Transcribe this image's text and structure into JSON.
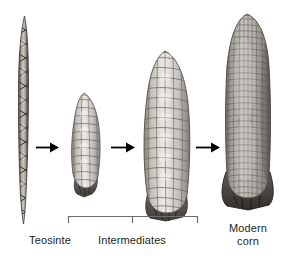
{
  "figure": {
    "background_color": "#ffffff",
    "text_color": "#231f20",
    "arrow_color": "#000000",
    "bracket_color": "#6d6e71"
  },
  "specimens": [
    {
      "id": "teosinte",
      "name": "teosinte-ear",
      "label": "Teosinte",
      "description": "narrow two-ranked spike with few triangular fruitcases",
      "x": 18,
      "y": 18,
      "width": 13,
      "height": 205,
      "kernel_rows": 2,
      "kernel_columns": 14,
      "tone_light": "#c9c6c1",
      "tone_dark": "#4a4642"
    },
    {
      "id": "intermediate-small",
      "name": "intermediate-small-ear",
      "label": "",
      "description": "small intermediate ear with rounded kernels and husk base",
      "x": 68,
      "y": 93,
      "width": 40,
      "height": 99,
      "kernel_rows": 12,
      "kernel_columns": 6,
      "tone_light": "#e6e3df",
      "tone_dark": "#6e6a66"
    },
    {
      "id": "intermediate-large",
      "name": "intermediate-large-ear",
      "label": "",
      "description": "larger intermediate ear, broader with more kernel rows",
      "x": 140,
      "y": 52,
      "width": 56,
      "height": 163,
      "kernel_rows": 18,
      "kernel_columns": 9,
      "tone_light": "#e9e6e2",
      "tone_dark": "#6a6662"
    },
    {
      "id": "modern-corn",
      "name": "modern-corn-ear",
      "label": "Modern\ncorn",
      "description": "large modern corn ear with dense fine kernel rows",
      "x": 222,
      "y": 15,
      "width": 51,
      "height": 192,
      "kernel_rows": 34,
      "kernel_columns": 14,
      "tone_light": "#b8b5b1",
      "tone_dark": "#595551"
    }
  ],
  "arrows": [
    {
      "id": "arrow-1",
      "from": "teosinte",
      "to": "intermediate-small",
      "x": 36,
      "y": 147,
      "length": 22
    },
    {
      "id": "arrow-2",
      "from": "intermediate-small",
      "to": "intermediate-large",
      "x": 112,
      "y": 147,
      "length": 23
    },
    {
      "id": "arrow-3",
      "from": "intermediate-large",
      "to": "modern-corn",
      "x": 196,
      "y": 147,
      "length": 23
    }
  ],
  "bracket": {
    "id": "intermediates-bracket",
    "label": "Intermediates",
    "left": 68,
    "right": 196,
    "y": 216,
    "tick_x": 132,
    "end_drop": 7,
    "tick_drop": 6
  },
  "labels": [
    {
      "id": "label-teosinte",
      "name": "teosinte-label",
      "text": "Teosinte",
      "x": 50,
      "y": 236
    },
    {
      "id": "label-intermediates",
      "name": "intermediates-label",
      "text": "Intermediates",
      "x": 132,
      "y": 236
    },
    {
      "id": "label-modern-corn",
      "name": "modern-corn-label",
      "text": "Modern\ncorn",
      "x": 248,
      "y": 224
    }
  ]
}
